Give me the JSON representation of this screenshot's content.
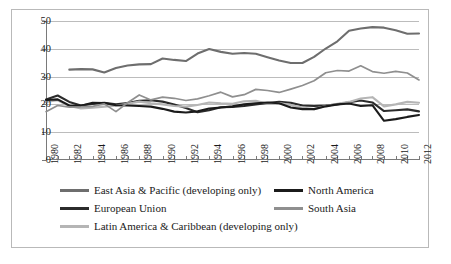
{
  "chart_data": {
    "type": "line",
    "title": "",
    "xlabel": "",
    "ylabel": "",
    "xlim": [
      1980,
      2012
    ],
    "ylim": [
      0,
      50
    ],
    "yticks": [
      0,
      10,
      20,
      30,
      40,
      50
    ],
    "xticks": [
      1980,
      1982,
      1984,
      1986,
      1988,
      1990,
      1992,
      1994,
      1996,
      1998,
      2000,
      2002,
      2004,
      2006,
      2008,
      2010,
      2012
    ],
    "grid": "horizontal",
    "legend_position": "bottom",
    "x": [
      1980,
      1981,
      1982,
      1983,
      1984,
      1985,
      1986,
      1987,
      1988,
      1989,
      1990,
      1991,
      1992,
      1993,
      1994,
      1995,
      1996,
      1997,
      1998,
      1999,
      2000,
      2001,
      2002,
      2003,
      2004,
      2005,
      2006,
      2007,
      2008,
      2009,
      2010,
      2011,
      2012
    ],
    "series": [
      {
        "name": "East Asia & Pacific (developing only)",
        "color": "#6e6e6e",
        "width": 2.1,
        "values": [
          null,
          null,
          32.5,
          32.7,
          32.6,
          31.5,
          33.1,
          34.0,
          34.4,
          34.5,
          36.5,
          36.0,
          35.6,
          38.3,
          39.9,
          38.9,
          38.2,
          38.5,
          38.2,
          37.0,
          35.8,
          34.9,
          34.9,
          37.1,
          40.1,
          42.7,
          46.5,
          47.3,
          47.8,
          47.6,
          46.7,
          45.4,
          45.5
        ]
      },
      {
        "name": "European Union",
        "color": "#2b2b2b",
        "width": 2.1,
        "values": [
          21.8,
          23.2,
          20.9,
          19.6,
          20.2,
          20.6,
          20.0,
          20.5,
          21.3,
          21.5,
          21.0,
          20.0,
          18.7,
          17.2,
          17.9,
          19.0,
          19.1,
          19.4,
          20.0,
          20.5,
          20.9,
          20.6,
          19.6,
          19.4,
          19.6,
          20.0,
          20.8,
          21.4,
          20.7,
          17.6,
          17.9,
          18.2,
          17.5
        ]
      },
      {
        "name": "Latin America & Caribbean (developing only)",
        "color": "#b5b5b5",
        "width": 2.1,
        "values": [
          20.9,
          21.5,
          19.4,
          18.5,
          18.8,
          19.2,
          19.5,
          20.2,
          21.0,
          20.4,
          20.0,
          19.4,
          19.2,
          19.8,
          20.7,
          20.4,
          20.2,
          21.1,
          21.3,
          20.2,
          20.5,
          19.8,
          18.9,
          18.3,
          19.4,
          20.2,
          20.9,
          22.1,
          22.6,
          19.3,
          20.0,
          20.9,
          20.6
        ]
      },
      {
        "name": "North America",
        "color": "#1b1b1b",
        "width": 2.1,
        "values": [
          21.6,
          21.8,
          19.6,
          19.5,
          20.6,
          20.5,
          19.7,
          19.6,
          19.4,
          19.2,
          18.4,
          17.4,
          17.1,
          17.5,
          18.5,
          18.9,
          19.3,
          20.0,
          20.4,
          20.7,
          20.4,
          18.9,
          18.3,
          18.3,
          19.3,
          20.0,
          20.3,
          19.4,
          19.7,
          14.1,
          14.7,
          15.5,
          16.2
        ]
      },
      {
        "name": "South Asia",
        "color": "#8f8f8f",
        "width": 1.7,
        "values": [
          17.4,
          19.6,
          19.0,
          19.1,
          19.3,
          20.2,
          17.4,
          20.6,
          23.4,
          21.6,
          22.6,
          22.2,
          21.4,
          22.0,
          23.1,
          24.4,
          22.7,
          23.5,
          25.4,
          25.0,
          24.3,
          25.5,
          26.8,
          28.5,
          31.4,
          32.2,
          32.0,
          33.9,
          31.8,
          31.2,
          31.9,
          31.3,
          28.8
        ]
      }
    ],
    "series_axis_note": ""
  },
  "legend": {
    "rows": [
      {
        "label": "East Asia & Pacific (developing only)",
        "color": "#6e6e6e",
        "column": 0,
        "row": 0
      },
      {
        "label": "European Union",
        "color": "#2b2b2b",
        "column": 0,
        "row": 1
      },
      {
        "label": "Latin America & Caribbean (developing only)",
        "color": "#b5b5b5",
        "column": 0,
        "row": 2
      },
      {
        "label": "North America",
        "color": "#1b1b1b",
        "column": 1,
        "row": 0
      },
      {
        "label": "South Asia",
        "color": "#8f8f8f",
        "column": 1,
        "row": 1
      }
    ]
  },
  "axis": {
    "y_labels": [
      "50",
      "40",
      "30",
      "20",
      "10",
      "0"
    ],
    "x_labels": [
      "1980",
      "1982",
      "1984",
      "1986",
      "1988",
      "1990",
      "1992",
      "1994",
      "1996",
      "1998",
      "2000",
      "2002",
      "2004",
      "2006",
      "2008",
      "2010",
      "2012"
    ]
  },
  "colors": {
    "border": "#b9b9b9",
    "gridline": "#bcbcbc",
    "axis": "#7a7a7a",
    "text": "#1a1a1a",
    "background": "#ffffff"
  }
}
